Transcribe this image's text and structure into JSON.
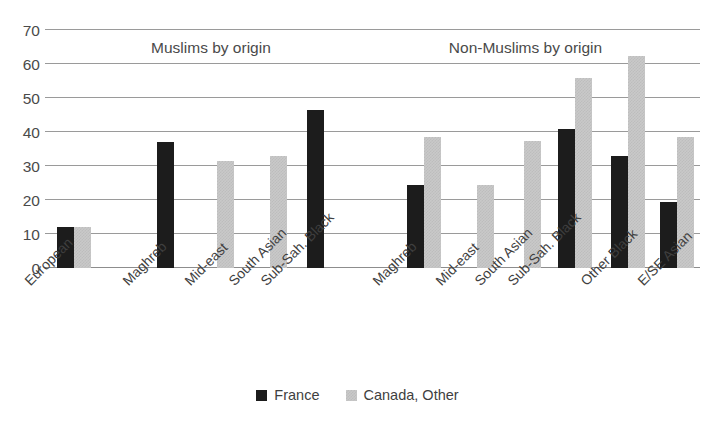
{
  "chart_data": {
    "type": "bar",
    "title": "",
    "xlabel": "",
    "ylabel": "",
    "ylim": [
      0,
      70
    ],
    "yticks": [
      0,
      10,
      20,
      30,
      40,
      50,
      60,
      70
    ],
    "grid": true,
    "legend_position": "bottom",
    "group_headers": [
      {
        "label": "Muslims by origin",
        "x_center_pct": 29.5
      },
      {
        "label": "Non-Muslims by origin",
        "x_center_pct": 73.5
      }
    ],
    "categories": [
      "European",
      "Maghreb",
      "Mid-east",
      "South Asian",
      "Sub-Sah. Black",
      "Maghreb",
      "Mid-east",
      "South Asian",
      "Sub-Sah. Black",
      "Other Black",
      "E/SE Asian"
    ],
    "series": [
      {
        "name": "France",
        "color": "#1c1c1c",
        "values": [
          12,
          37,
          null,
          null,
          46.5,
          24.5,
          null,
          null,
          41,
          33,
          19.5
        ]
      },
      {
        "name": "Canada, Other",
        "color": "#c9c9c9",
        "values": [
          12,
          null,
          31.5,
          33,
          null,
          38.5,
          24.5,
          37.5,
          56,
          62.5,
          38.5
        ]
      }
    ],
    "bars": [
      {
        "category": "European",
        "group": "Muslims by origin",
        "series": "France",
        "value": 12,
        "x": 57,
        "w": 17
      },
      {
        "category": "European",
        "group": "Muslims by origin",
        "series": "Canada, Other",
        "value": 12,
        "x": 74,
        "w": 17
      },
      {
        "category": "Maghreb",
        "group": "Muslims by origin",
        "series": "France",
        "value": 37,
        "x": 157,
        "w": 17
      },
      {
        "category": "Mid-east",
        "group": "Muslims by origin",
        "series": "Canada, Other",
        "value": 31.5,
        "x": 217,
        "w": 17
      },
      {
        "category": "South Asian",
        "group": "Muslims by origin",
        "series": "Canada, Other",
        "value": 33,
        "x": 270,
        "w": 17
      },
      {
        "category": "Sub-Sah. Black",
        "group": "Muslims by origin",
        "series": "France",
        "value": 46.5,
        "x": 307,
        "w": 17
      },
      {
        "category": "Maghreb",
        "group": "Non-Muslims by origin",
        "series": "France",
        "value": 24.5,
        "x": 407,
        "w": 17
      },
      {
        "category": "Maghreb",
        "group": "Non-Muslims by origin",
        "series": "Canada, Other",
        "value": 38.5,
        "x": 424,
        "w": 17
      },
      {
        "category": "Mid-east",
        "group": "Non-Muslims by origin",
        "series": "Canada, Other",
        "value": 24.5,
        "x": 477,
        "w": 17
      },
      {
        "category": "South Asian",
        "group": "Non-Muslims by origin",
        "series": "Canada, Other",
        "value": 37.5,
        "x": 524,
        "w": 17
      },
      {
        "category": "Sub-Sah. Black",
        "group": "Non-Muslims by origin",
        "series": "France",
        "value": 41,
        "x": 558,
        "w": 17
      },
      {
        "category": "Sub-Sah. Black",
        "group": "Non-Muslims by origin",
        "series": "Canada, Other",
        "value": 56,
        "x": 575,
        "w": 17
      },
      {
        "category": "Other Black",
        "group": "Non-Muslims by origin",
        "series": "France",
        "value": 33,
        "x": 611,
        "w": 17
      },
      {
        "category": "Other Black",
        "group": "Non-Muslims by origin",
        "series": "Canada, Other",
        "value": 62.5,
        "x": 628,
        "w": 17
      },
      {
        "category": "E/SE Asian",
        "group": "Non-Muslims by origin",
        "series": "France",
        "value": 19.5,
        "x": 660,
        "w": 17
      },
      {
        "category": "E/SE Asian",
        "group": "Non-Muslims by origin",
        "series": "Canada, Other",
        "value": 38.5,
        "x": 677,
        "w": 17
      }
    ],
    "category_label_positions": [
      {
        "label": "European",
        "x": 22
      },
      {
        "label": "Maghreb",
        "x": 120
      },
      {
        "label": "Mid-east",
        "x": 182
      },
      {
        "label": "South Asian",
        "x": 226
      },
      {
        "label": "Sub-Sah. Black",
        "x": 258
      },
      {
        "label": "Maghreb",
        "x": 370
      },
      {
        "label": "Mid-east",
        "x": 433
      },
      {
        "label": "South Asian",
        "x": 472
      },
      {
        "label": "Sub-Sah. Black",
        "x": 505
      },
      {
        "label": "Other Black",
        "x": 578
      },
      {
        "label": "E/SE Asian",
        "x": 635
      }
    ]
  },
  "legend": {
    "items": [
      {
        "label": "France",
        "color": "#1c1c1c"
      },
      {
        "label": "Canada, Other",
        "color": "#c9c9c9"
      }
    ]
  }
}
